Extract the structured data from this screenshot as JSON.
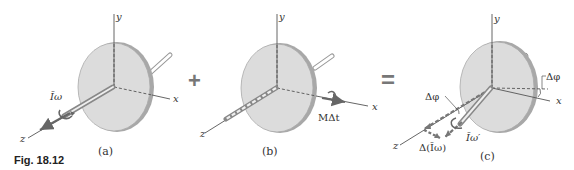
{
  "figure": {
    "label": "Fig. 18.12"
  },
  "operators": {
    "plus": "+",
    "equals": "="
  },
  "panels": [
    {
      "id": "a",
      "caption": "(a)",
      "axes": {
        "x": "x",
        "y": "y",
        "z": "z"
      },
      "vectors": [
        {
          "label": "Īω",
          "meaning": "angular momentum along z axis"
        }
      ]
    },
    {
      "id": "b",
      "caption": "(b)",
      "axes": {
        "x": "x",
        "y": "y",
        "z": "z"
      },
      "vectors": [
        {
          "label": "MΔt",
          "meaning": "angular impulse along x axis"
        }
      ]
    },
    {
      "id": "c",
      "caption": "(c)",
      "axes": {
        "x": "x",
        "y": "y",
        "z": "z"
      },
      "vectors": [
        {
          "label": "Īω′",
          "meaning": "resulting angular momentum"
        },
        {
          "label": "Δ(Īω)",
          "meaning": "change of angular momentum"
        }
      ],
      "angles": [
        {
          "label": "Δφ",
          "position": "left"
        },
        {
          "label": "Δφ",
          "position": "right"
        }
      ]
    }
  ],
  "colors": {
    "disk_fill": "#dcdcdc",
    "disk_edge": "#9a9a9a",
    "axis_line": "#555555",
    "vector_arrow": "#666666",
    "text": "#333333"
  }
}
